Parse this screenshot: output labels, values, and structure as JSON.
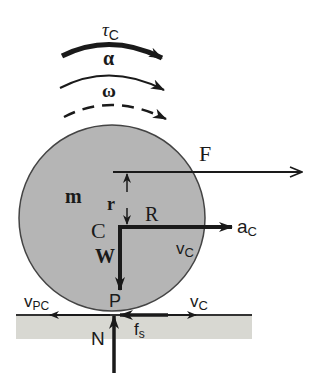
{
  "diagram": {
    "colors": {
      "wheel_fill": "#b5b5b5",
      "wheel_stroke": "#444444",
      "ground_fill": "#d8d8d2",
      "ink": "#1a1a1a"
    },
    "rotation_labels": {
      "torque": "τ",
      "torque_sub": "C",
      "angular_accel": "α",
      "angular_vel": "ω"
    },
    "wheel_labels": {
      "mass": "m",
      "center": "C",
      "radius": "R",
      "offset": "r",
      "weight": "W",
      "contact_point": "P"
    },
    "force_labels": {
      "applied_force": "F",
      "accel": "a",
      "accel_sub": "C",
      "velocity_center": "v",
      "velocity_center_sub": "C",
      "velocity_ground": "v",
      "velocity_ground_sub": "C",
      "velocity_pc": "v",
      "velocity_pc_sub": "PC",
      "friction": "f",
      "friction_sub": "s",
      "normal": "N"
    }
  }
}
